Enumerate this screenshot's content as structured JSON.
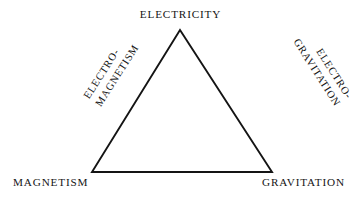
{
  "diagram": {
    "shape": "triangle",
    "stroke_color": "#141414",
    "text_color": "#151515",
    "background_color": "#ffffff",
    "vertices": [
      {
        "id": "top",
        "label": "ELECTRICITY"
      },
      {
        "id": "bottom-left",
        "label": "MAGNETISM"
      },
      {
        "id": "bottom-right",
        "label": "GRAVITATION"
      }
    ],
    "edges": [
      {
        "id": "left-edge",
        "connects": "ELECTRICITY-MAGNETISM",
        "line1": "ELECTRO-",
        "line2": "MAGNETISM",
        "rotation_deg": -57.5
      },
      {
        "id": "right-edge",
        "connects": "ELECTRICITY-GRAVITATION",
        "line1": "ELECTRO-",
        "line2": "GRAVITATION",
        "rotation_deg": 57.5
      }
    ],
    "geometry": {
      "apex": "180,30",
      "bottom_left": "92,172",
      "bottom_right": "272,172"
    }
  }
}
